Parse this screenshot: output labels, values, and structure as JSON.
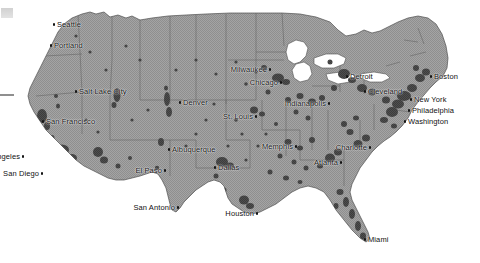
{
  "map": {
    "title": "United States urbanized areas map",
    "region": "Contiguous United States",
    "colors": {
      "land": "#9b9b9b",
      "land_alt": "#a6a6a6",
      "urban": "#4a4a4a",
      "urban_dark": "#3a3a3a",
      "border": "#5d5d5d",
      "coastline": "#4f4f4f",
      "background": "#ffffff",
      "label_text": "#111111",
      "marker": "#141414"
    },
    "legend": null,
    "scale_bar": null,
    "marks": {
      "corner_smudge": "gray-smudge",
      "edge_tick": "edge-tick-line"
    },
    "cities": [
      {
        "name": "Seattle",
        "x": 57,
        "y": 21,
        "side": "r"
      },
      {
        "name": "Portland",
        "x": 54,
        "y": 42,
        "side": "r"
      },
      {
        "name": "Salt Lake City",
        "x": 79,
        "y": 88,
        "side": "r"
      },
      {
        "name": "San Francisco",
        "x": 46,
        "y": 118,
        "side": "r"
      },
      {
        "name": "Los Angeles",
        "x": 20,
        "y": 153,
        "side": "l"
      },
      {
        "name": "San Diego",
        "x": 39,
        "y": 170,
        "side": "l"
      },
      {
        "name": "Denver",
        "x": 183,
        "y": 99,
        "side": "r"
      },
      {
        "name": "Albuquerque",
        "x": 172,
        "y": 146,
        "side": "r"
      },
      {
        "name": "El Paso",
        "x": 162,
        "y": 167,
        "side": "l"
      },
      {
        "name": "Dallas",
        "x": 218,
        "y": 164,
        "side": "r"
      },
      {
        "name": "San Antonio",
        "x": 175,
        "y": 204,
        "side": "l"
      },
      {
        "name": "Houston",
        "x": 254,
        "y": 210,
        "side": "l"
      },
      {
        "name": "Milwaukee",
        "x": 267,
        "y": 66,
        "side": "l"
      },
      {
        "name": "Chicago",
        "x": 278,
        "y": 79,
        "side": "l"
      },
      {
        "name": "St. Louis",
        "x": 253,
        "y": 113,
        "side": "l"
      },
      {
        "name": "Memphis",
        "x": 293,
        "y": 143,
        "side": "l"
      },
      {
        "name": "Atlanta",
        "x": 338,
        "y": 159,
        "side": "l"
      },
      {
        "name": "Charlotte",
        "x": 367,
        "y": 144,
        "side": "l"
      },
      {
        "name": "Miami",
        "x": 368,
        "y": 236,
        "side": "r"
      },
      {
        "name": "Detroit",
        "x": 350,
        "y": 73,
        "side": "r"
      },
      {
        "name": "Cleveland",
        "x": 368,
        "y": 88,
        "side": "r"
      },
      {
        "name": "Indianapolis",
        "x": 326,
        "y": 100,
        "side": "l"
      },
      {
        "name": "Boston",
        "x": 434,
        "y": 73,
        "side": "r"
      },
      {
        "name": "New York",
        "x": 414,
        "y": 96,
        "side": "r"
      },
      {
        "name": "Philadelphia",
        "x": 412,
        "y": 107,
        "side": "r"
      },
      {
        "name": "Washington",
        "x": 408,
        "y": 118,
        "side": "r"
      }
    ]
  }
}
